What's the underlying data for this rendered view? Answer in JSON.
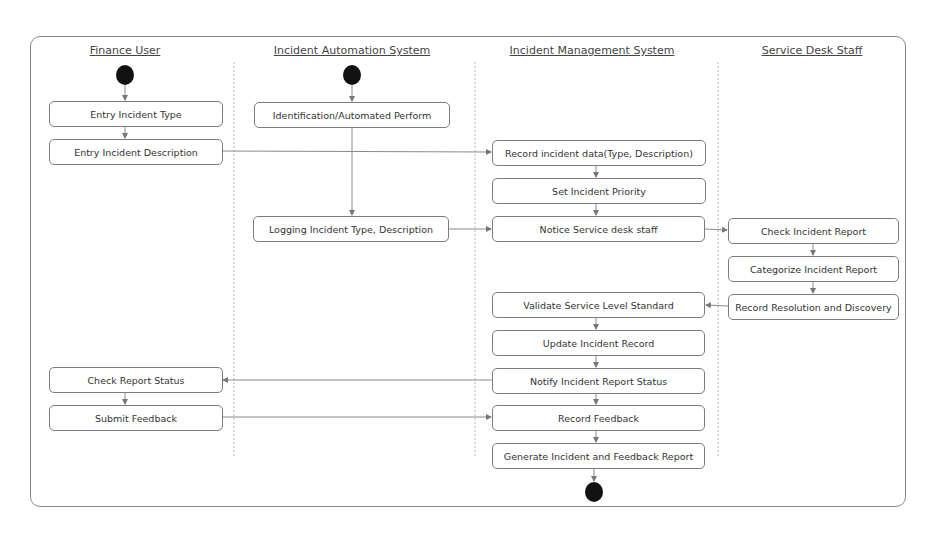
{
  "diagram": {
    "type": "UML activity diagram",
    "lanes": [
      {
        "id": "finance",
        "title": "Finance User",
        "cx": 125
      },
      {
        "id": "ias",
        "title": "Incident Automation System",
        "cx": 352
      },
      {
        "id": "ims",
        "title": "Incident Management System",
        "cx": 592
      },
      {
        "id": "sds",
        "title": "Service Desk Staff",
        "cx": 812
      }
    ],
    "nodes": {
      "entry_type": "Entry Incident Type",
      "entry_desc": "Entry Incident Description",
      "check_status": "Check Report Status",
      "submit_feedback": "Submit Feedback",
      "identification": "Identification/Automated Perform",
      "logging": "Logging Incident Type, Description",
      "record_data": "Record incident data(Type, Description)",
      "set_priority": "Set Incident Priority",
      "notice_staff": "Notice Service desk staff",
      "validate_sls": "Validate Service Level Standard",
      "update_record": "Update Incident Record",
      "notify_status": "Notify Incident Report Status",
      "record_feedback": "Record Feedback",
      "generate_report": "Generate Incident and Feedback Report",
      "check_report": "Check Incident Report",
      "categorize": "Categorize Incident Report",
      "record_resolution": "Record Resolution and Discovery"
    },
    "start_nodes": [
      "finance",
      "ias"
    ],
    "end_nodes": [
      "ims"
    ],
    "flows": [
      [
        "start-finance",
        "entry_type"
      ],
      [
        "entry_type",
        "entry_desc"
      ],
      [
        "entry_desc",
        "record_data"
      ],
      [
        "start-ias",
        "identification"
      ],
      [
        "identification",
        "logging"
      ],
      [
        "logging",
        "notice_staff"
      ],
      [
        "record_data",
        "set_priority"
      ],
      [
        "set_priority",
        "notice_staff"
      ],
      [
        "notice_staff",
        "check_report"
      ],
      [
        "check_report",
        "categorize"
      ],
      [
        "categorize",
        "record_resolution"
      ],
      [
        "record_resolution",
        "validate_sls"
      ],
      [
        "validate_sls",
        "update_record"
      ],
      [
        "update_record",
        "notify_status"
      ],
      [
        "notify_status",
        "check_status"
      ],
      [
        "check_status",
        "submit_feedback"
      ],
      [
        "submit_feedback",
        "record_feedback"
      ],
      [
        "notify_status",
        "record_feedback"
      ],
      [
        "record_feedback",
        "generate_report"
      ],
      [
        "generate_report",
        "end"
      ]
    ]
  },
  "colors": {
    "border": "#7d7d7d",
    "line": "#8a8a8a",
    "node_fill": "#ffffff",
    "start_end": "#111111"
  }
}
